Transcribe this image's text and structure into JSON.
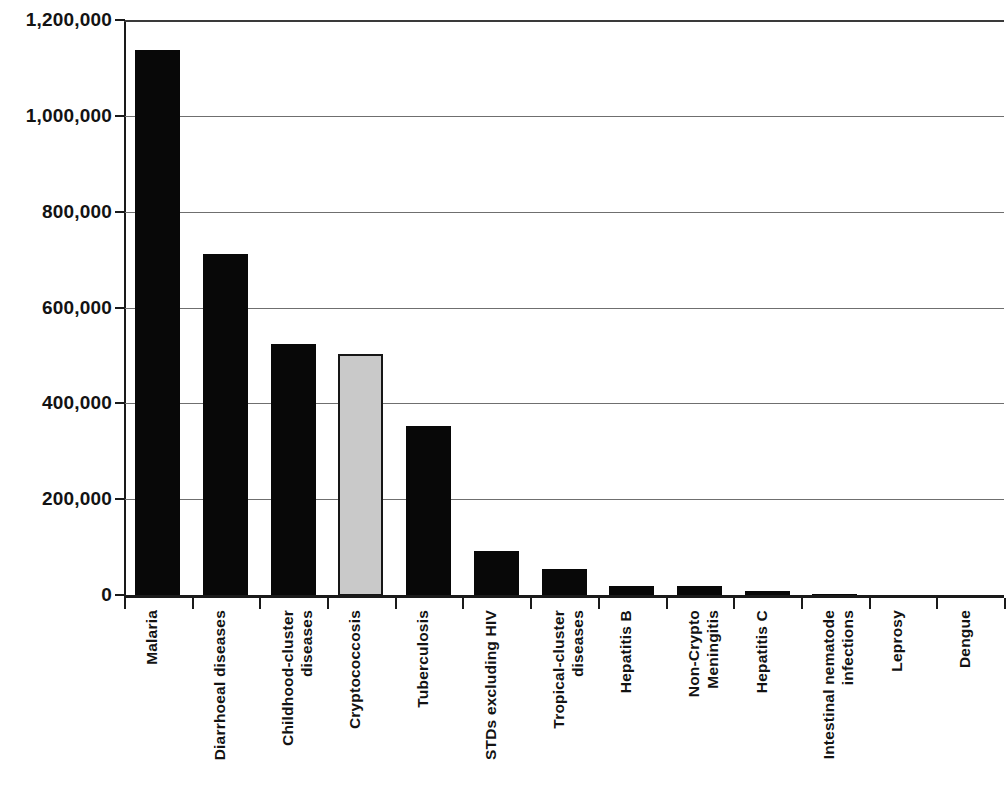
{
  "chart_data": {
    "type": "bar",
    "title": "",
    "subtitle": "",
    "xlabel": "",
    "ylabel": "",
    "ylim": [
      0,
      1200000
    ],
    "grid": true,
    "legend": "none",
    "orientation": "vertical",
    "x_tick_rotation": 90,
    "categories": [
      "Malaria",
      "Diarrhoeal diseases",
      "Childhood-cluster diseases",
      "Cryptococcosis",
      "Tuberculosis",
      "STDs excluding HIV",
      "Tropical-cluster diseases",
      "Hepatitis B",
      "Non-Crypto Meningitis",
      "Hepatitis C",
      "Intestinal nematode infections",
      "Leprosy",
      "Dengue"
    ],
    "category_lines": [
      [
        "Malaria"
      ],
      [
        "Diarrhoeal diseases"
      ],
      [
        "Childhood-cluster",
        "diseases"
      ],
      [
        "Cryptococcosis"
      ],
      [
        "Tuberculosis"
      ],
      [
        "STDs excluding HIV"
      ],
      [
        "Tropical-cluster",
        "diseases"
      ],
      [
        "Hepatitis B"
      ],
      [
        "Non-Crypto",
        "Meningitis"
      ],
      [
        "Hepatitis C"
      ],
      [
        "Intestinal nematode",
        "infections"
      ],
      [
        "Leprosy"
      ],
      [
        "Dengue"
      ]
    ],
    "values": [
      1139000,
      714000,
      526000,
      505000,
      355000,
      94000,
      56000,
      21000,
      21000,
      10000,
      5000,
      0,
      0
    ],
    "highlight_index": 3,
    "bar_colors": [
      "#080808",
      "#080808",
      "#080808",
      "#c9c9c9",
      "#080808",
      "#080808",
      "#080808",
      "#080808",
      "#080808",
      "#080808",
      "#080808",
      "#080808",
      "#080808"
    ],
    "y_ticks": [
      0,
      200000,
      400000,
      600000,
      800000,
      1000000,
      1200000
    ],
    "y_tick_labels": [
      "0",
      "200,000",
      "400,000",
      "600,000",
      "800,000",
      "1,000,000",
      "1,200,000"
    ],
    "colors": {
      "bar_dark": "#080808",
      "bar_highlight": "#c9c9c9",
      "bar_highlight_border": "#161616",
      "axis": "#1a1a1a",
      "gridline": "#6f6f6f",
      "text": "#131313",
      "background": "#ffffff"
    }
  }
}
